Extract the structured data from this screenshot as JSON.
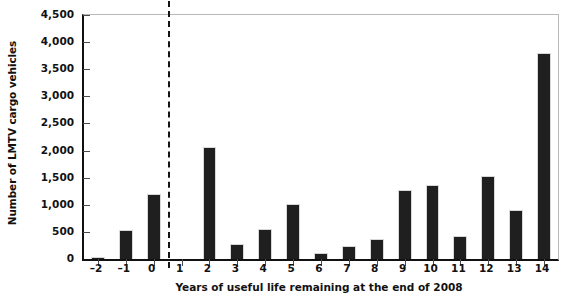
{
  "chart_data": {
    "type": "bar",
    "title": "",
    "xlabel": "Years of useful life remaining at the end of 2008",
    "ylabel": "Number of LMTV cargo vehicles",
    "categories": [
      "-2",
      "-1",
      "0",
      "1",
      "2",
      "3",
      "4",
      "5",
      "6",
      "7",
      "8",
      "9",
      "10",
      "11",
      "12",
      "13",
      "14"
    ],
    "category_labels": [
      "–2",
      "–1",
      "0",
      "1",
      "2",
      "3",
      "4",
      "5",
      "6",
      "7",
      "8",
      "9",
      "10",
      "11",
      "12",
      "13",
      "14"
    ],
    "values": [
      30,
      530,
      1200,
      0,
      2070,
      280,
      545,
      1010,
      120,
      240,
      365,
      1280,
      1370,
      420,
      1530,
      910,
      3800
    ],
    "ylim": [
      0,
      4500
    ],
    "ytick_values": [
      0,
      500,
      1000,
      1500,
      2000,
      2500,
      3000,
      3500,
      4000,
      4500
    ],
    "ytick_labels": [
      "0",
      "500",
      "1,000",
      "1,500",
      "2,000",
      "2,500",
      "3,000",
      "3,500",
      "4,000",
      "4,500"
    ],
    "grid": false,
    "legend": null,
    "annotations": [
      {
        "name": "divider-line",
        "type": "vertical-dashed-line",
        "x_between": [
          "0",
          "1"
        ],
        "description": "Dashed vertical line separating past-due years from remaining years"
      }
    ],
    "bar_color": "#1f1f1f",
    "axis_color": "#111111",
    "frame_color": "#b9b9b9",
    "background_color": "#ffffff"
  }
}
